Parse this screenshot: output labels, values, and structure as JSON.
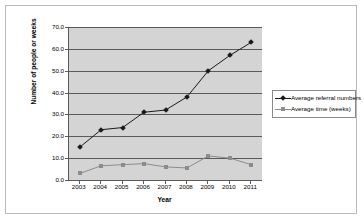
{
  "chart_data": {
    "type": "line",
    "title": "",
    "xlabel": "Year",
    "ylabel": "Number of people or weeks",
    "categories": [
      "2003",
      "2004",
      "2005",
      "2006",
      "2007",
      "2008",
      "2009",
      "2010",
      "2011"
    ],
    "ylim": [
      0.0,
      70.0
    ],
    "ytick_labels": [
      "0.0",
      "10.0",
      "20.0",
      "30.0",
      "40.0",
      "50.0",
      "60.0",
      "70.0"
    ],
    "ytick_values": [
      0.0,
      10.0,
      20.0,
      30.0,
      40.0,
      50.0,
      60.0,
      70.0
    ],
    "grid": true,
    "legend_position": "right",
    "series": [
      {
        "name": "Average referral numbers",
        "marker": "diamond",
        "color": "#1a1a1a",
        "values": [
          15.0,
          23.0,
          24.0,
          31.0,
          32.0,
          38.0,
          50.0,
          57.0,
          63.0
        ]
      },
      {
        "name": "Average time (weeks)",
        "marker": "square",
        "color": "#8c8c8c",
        "values": [
          3.0,
          6.5,
          7.0,
          7.5,
          6.0,
          5.5,
          11.0,
          10.0,
          7.0
        ]
      }
    ],
    "plot_background": "#d4d4d4",
    "axis_color": "#5a5a5a"
  }
}
